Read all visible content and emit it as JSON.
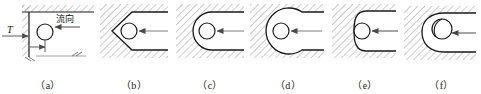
{
  "figure": {
    "background_color": "#ffffff",
    "line_color": "#1a1a1a",
    "hatch_color": "#8a8a8a",
    "arrow_color": "#555555",
    "width": 481,
    "height": 94
  },
  "annotations": {
    "flow_direction_label": "流向",
    "thickness_label": "T"
  },
  "panels": [
    {
      "id": "a",
      "caption": "（a）",
      "shape": "right-angle-corner",
      "description": "L-shaped hatched corner wall with circular element in the corner, flow direction arrow and T thickness dimension"
    },
    {
      "id": "b",
      "caption": "（b）",
      "shape": "v-chevron-pocket",
      "description": "Chevron / V-shaped hatched pocket with circular element at apex and flow arrow"
    },
    {
      "id": "c",
      "caption": "（c）",
      "shape": "u-semicircular-pocket",
      "description": "U-shaped semicircular hatched pocket with circular element and flow arrow"
    },
    {
      "id": "d",
      "caption": "（d）",
      "shape": "circular-cavity-narrow-neck",
      "description": "Large circular cavity with narrow neck opening, circular element centered, flow arrow"
    },
    {
      "id": "e",
      "caption": "（e）",
      "shape": "double-concave-pinch",
      "description": "Two concave curves pinching at the circular element, hatched wall, flow arrow"
    },
    {
      "id": "f",
      "caption": "（f）",
      "shape": "spiral-hook-overlap",
      "description": "Spiral hook profile overlapping the circular element with hatched wall and flow arrow"
    }
  ]
}
